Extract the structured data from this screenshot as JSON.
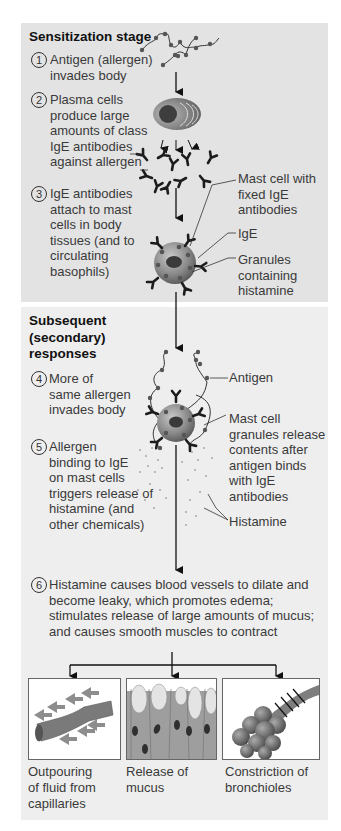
{
  "sensitization": {
    "heading": "Sensitization stage",
    "steps": [
      {
        "num": "1",
        "text": "Antigen (allergen)\ninvades body"
      },
      {
        "num": "2",
        "text": "Plasma cells\nproduce large\namounts of class\nIgE antibodies\nagainst allergen"
      },
      {
        "num": "3",
        "text": "IgE antibodies\nattach to mast\ncells in body\ntissues (and to\ncirculating\nbasophils)"
      }
    ],
    "labels": {
      "mast_cell": "Mast cell with\nfixed IgE\nantibodies",
      "ige": "IgE",
      "granules": "Granules\ncontaining\nhistamine"
    }
  },
  "secondary": {
    "heading": "Subsequent\n(secondary)\nresponses",
    "steps": [
      {
        "num": "4",
        "text": "More of\nsame allergen\ninvades body"
      },
      {
        "num": "5",
        "text": "Allergen\nbinding to IgE\non mast cells\ntriggers release of\nhistamine (and\nother chemicals)"
      },
      {
        "num": "6",
        "text": "Histamine causes blood vessels to dilate and\nbecome leaky, which promotes edema;\nstimulates release of large amounts of mucus;\nand causes smooth muscles to contract"
      }
    ],
    "labels": {
      "antigen": "Antigen",
      "mast_cell_release": "Mast cell\ngranules release\ncontents after\nantigen binds\nwith IgE\nantibodies",
      "histamine": "Histamine"
    }
  },
  "outcomes": [
    {
      "caption": "Outpouring\nof fluid from\ncapillaries",
      "icon": "capillary-icon"
    },
    {
      "caption": "Release of\nmucus",
      "icon": "mucus-cells-icon"
    },
    {
      "caption": "Constriction of\nbronchioles",
      "icon": "bronchioles-icon"
    }
  ],
  "colors": {
    "top_panel": "#e3e3e3",
    "bottom_panel": "#eeeeee",
    "cell": "#8a8a8a",
    "antibody": "#222222"
  }
}
